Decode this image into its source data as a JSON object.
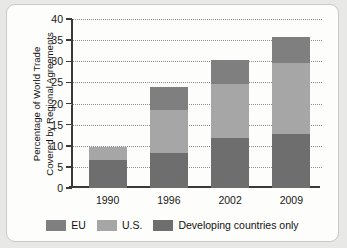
{
  "chart_data": {
    "type": "bar",
    "subtype": "stacked-bar",
    "title": "",
    "xlabel": "",
    "ylabel": "Percentage of World Trade Covered by Regional Agreements",
    "ylabel_lines": [
      "Percentage of World Trade",
      "Covered by Regional Agreements"
    ],
    "categories": [
      "1990",
      "1996",
      "2002",
      "2009"
    ],
    "ylim": [
      0,
      40
    ],
    "yticks": [
      0,
      5,
      10,
      15,
      20,
      25,
      30,
      35,
      40
    ],
    "ytick_labels": [
      "0",
      "5",
      "10",
      "15",
      "20",
      "25",
      "30",
      "35",
      "40"
    ],
    "grid": true,
    "grid_style": "dotted",
    "legend_position": "bottom",
    "stack_order_bottom_to_top": [
      "Developing countries only",
      "U.S.",
      "EU"
    ],
    "series": [
      {
        "name": "Developing countries only",
        "color": "#6e6e6e",
        "values": [
          6.7,
          8.2,
          11.9,
          12.7
        ]
      },
      {
        "name": "U.S.",
        "color": "#a6a6a6",
        "values": [
          3.1,
          10.3,
          12.8,
          16.9
        ]
      },
      {
        "name": "EU",
        "color": "#7f7f7f",
        "values": [
          0.0,
          5.5,
          5.6,
          6.1
        ]
      }
    ],
    "totals": [
      9.8,
      24.0,
      30.3,
      35.7
    ]
  },
  "legend": {
    "items": [
      {
        "label": "EU",
        "color": "#7f7f7f"
      },
      {
        "label": "U.S.",
        "color": "#a6a6a6"
      },
      {
        "label": "Developing countries only",
        "color": "#6e6e6e"
      }
    ]
  },
  "colors": {
    "page_background": "#e8e8e6",
    "figure_background": "#fdfdfb",
    "axis": "#3a3a3a",
    "gridline": "#8d8d8d",
    "text": "#171717"
  }
}
